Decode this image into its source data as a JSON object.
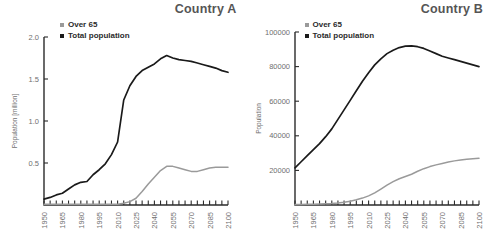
{
  "figure": {
    "background": "#ffffff",
    "series_colors": {
      "over65": "#9a9a9a",
      "total": "#1a1a1a"
    },
    "legend": {
      "over65_label": "Over 65",
      "total_label": "Total population"
    }
  },
  "chart_data": [
    {
      "type": "line",
      "title": "Country A",
      "xlabel": "",
      "ylabel": "Population [million]",
      "xlim": [
        1950,
        2100
      ],
      "ylim": [
        0,
        2.0
      ],
      "grid": false,
      "legend_position": "top-left",
      "xticks_major": [
        "1950",
        "1965",
        "1980",
        "1995",
        "2010",
        "2025",
        "2040",
        "2055",
        "2070",
        "2085",
        "2100"
      ],
      "xtick_minor_step": 5,
      "yticks": [
        "0.5",
        "1.0",
        "1.5",
        "2.0"
      ],
      "ytick_values": [
        0.5,
        1.0,
        1.5,
        2.0
      ],
      "x": [
        1950,
        1955,
        1960,
        1965,
        1970,
        1975,
        1980,
        1985,
        1990,
        1995,
        2000,
        2005,
        2010,
        2015,
        2020,
        2025,
        2030,
        2035,
        2040,
        2045,
        2050,
        2055,
        2060,
        2065,
        2070,
        2075,
        2080,
        2085,
        2090,
        2095,
        2100
      ],
      "series": [
        {
          "name": "Total population",
          "color": "#1a1a1a",
          "values": [
            0.07,
            0.09,
            0.12,
            0.14,
            0.19,
            0.24,
            0.27,
            0.28,
            0.36,
            0.42,
            0.49,
            0.6,
            0.75,
            1.25,
            1.42,
            1.53,
            1.6,
            1.64,
            1.68,
            1.74,
            1.78,
            1.75,
            1.73,
            1.72,
            1.71,
            1.69,
            1.67,
            1.65,
            1.63,
            1.6,
            1.58
          ]
        },
        {
          "name": "Over 65",
          "color": "#9a9a9a",
          "values": [
            0.01,
            0.01,
            0.01,
            0.01,
            0.01,
            0.01,
            0.01,
            0.01,
            0.01,
            0.01,
            0.01,
            0.01,
            0.01,
            0.02,
            0.04,
            0.08,
            0.16,
            0.25,
            0.33,
            0.41,
            0.46,
            0.46,
            0.44,
            0.42,
            0.4,
            0.4,
            0.42,
            0.44,
            0.45,
            0.45,
            0.45
          ]
        }
      ]
    },
    {
      "type": "line",
      "title": "Country B",
      "xlabel": "",
      "ylabel": "Population",
      "xlim": [
        1950,
        2100
      ],
      "ylim": [
        0,
        100000
      ],
      "grid": false,
      "legend_position": "top-left",
      "xticks_major": [
        "1950",
        "1965",
        "1980",
        "1995",
        "2010",
        "2025",
        "2040",
        "2055",
        "2070",
        "2085",
        "2100"
      ],
      "xtick_minor_step": 5,
      "yticks": [
        "20000",
        "40000",
        "60000",
        "80000",
        "100000"
      ],
      "ytick_values": [
        20000,
        40000,
        60000,
        80000,
        100000
      ],
      "x": [
        1950,
        1955,
        1960,
        1965,
        1970,
        1975,
        1980,
        1985,
        1990,
        1995,
        2000,
        2005,
        2010,
        2015,
        2020,
        2025,
        2030,
        2035,
        2040,
        2045,
        2050,
        2055,
        2060,
        2065,
        2070,
        2075,
        2080,
        2085,
        2090,
        2095,
        2100
      ],
      "series": [
        {
          "name": "Total population",
          "color": "#1a1a1a",
          "values": [
            21500,
            25000,
            28500,
            32000,
            35500,
            39500,
            44000,
            49500,
            55000,
            60500,
            66000,
            71500,
            76500,
            81000,
            84500,
            87500,
            89500,
            91000,
            91800,
            92000,
            91500,
            90500,
            89000,
            87500,
            86000,
            85000,
            84000,
            83000,
            82000,
            81000,
            80000
          ]
        },
        {
          "name": "Over 65",
          "color": "#9a9a9a",
          "values": [
            300,
            350,
            400,
            450,
            550,
            700,
            900,
            1200,
            1600,
            2200,
            3000,
            4000,
            5300,
            7000,
            9200,
            11500,
            13500,
            15200,
            16500,
            17800,
            19500,
            21000,
            22200,
            23200,
            24000,
            24800,
            25500,
            26000,
            26400,
            26700,
            27000
          ]
        }
      ]
    }
  ]
}
